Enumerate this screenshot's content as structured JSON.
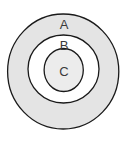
{
  "diagram": {
    "type": "concentric-circles",
    "colors": {
      "stroke": "#1a1a1a",
      "ring_a_fill": "#e4e4e4",
      "ring_b_fill": "#ffffff",
      "core_c_fill": "#ececec",
      "background": "#ffffff"
    },
    "regions": [
      {
        "id": "A",
        "label": "A"
      },
      {
        "id": "B",
        "label": "B"
      },
      {
        "id": "C",
        "label": "C"
      }
    ]
  }
}
